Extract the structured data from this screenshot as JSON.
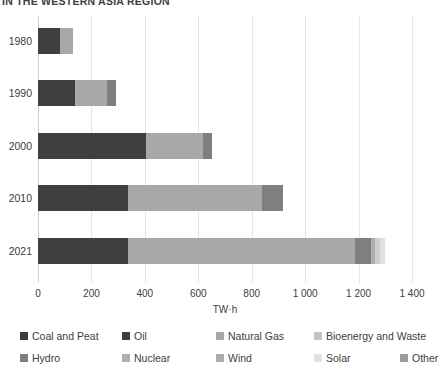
{
  "title": "IN THE WESTERN ASIA REGION",
  "axis": {
    "x_title": "TW·h",
    "x_ticks": [
      "0",
      "200",
      "400",
      "600",
      "800",
      "1 000",
      "1 200",
      "1 400"
    ],
    "x_tick_values": [
      0,
      200,
      400,
      600,
      800,
      1000,
      1200,
      1400
    ],
    "xmin": 0,
    "xmax": 1400
  },
  "legend": {
    "row1": [
      {
        "label": "Coal and Peat",
        "color": "#3b3b3b",
        "left": 20
      },
      {
        "label": "Oil",
        "color": "#3f3f3f",
        "left": 122
      },
      {
        "label": "Natural Gas",
        "color": "#a8a8a8",
        "left": 216
      },
      {
        "label": "Bioenergy and Waste",
        "color": "#c4c4c4",
        "left": 314
      }
    ],
    "row2": [
      {
        "label": "Hydro",
        "color": "#7f7f7f",
        "left": 20
      },
      {
        "label": "Nuclear",
        "color": "#b0b0b0",
        "left": 122
      },
      {
        "label": "Wind",
        "color": "#acacac",
        "left": 216
      },
      {
        "label": "Solar",
        "color": "#e2e2e2",
        "left": 314
      },
      {
        "label": "Other",
        "color": "#9a9a9a",
        "left": 400
      }
    ]
  },
  "chart_data": {
    "type": "bar",
    "orientation": "horizontal",
    "stacked": true,
    "title": "IN THE WESTERN ASIA REGION",
    "xlabel": "TW·h",
    "ylabel": "",
    "xlim": [
      0,
      1400
    ],
    "grid": true,
    "legend_position": "bottom",
    "categories": [
      "1980",
      "1990",
      "2000",
      "2010",
      "2021"
    ],
    "series": [
      {
        "name": "Coal and Peat",
        "color": "#3b3b3b",
        "values": [
          0,
          0,
          0,
          0,
          0
        ]
      },
      {
        "name": "Oil",
        "color": "#3f3f3f",
        "values": [
          82,
          139,
          404,
          337,
          337
        ]
      },
      {
        "name": "Natural Gas",
        "color": "#a8a8a8",
        "values": [
          48,
          120,
          213,
          502,
          850
        ]
      },
      {
        "name": "Bioenergy and Waste",
        "color": "#c4c4c4",
        "values": [
          0,
          0,
          0,
          0,
          0
        ]
      },
      {
        "name": "Hydro",
        "color": "#7f7f7f",
        "values": [
          0,
          34,
          34,
          79,
          60
        ]
      },
      {
        "name": "Nuclear",
        "color": "#b0b0b0",
        "values": [
          0,
          0,
          0,
          0,
          15
        ]
      },
      {
        "name": "Wind",
        "color": "#acacac",
        "values": [
          0,
          0,
          0,
          0,
          18
        ]
      },
      {
        "name": "Solar",
        "color": "#e2e2e2",
        "values": [
          0,
          0,
          0,
          0,
          20
        ]
      },
      {
        "name": "Other",
        "color": "#9a9a9a",
        "values": [
          0,
          0,
          0,
          0,
          0
        ]
      }
    ],
    "totals": [
      130,
      293,
      496,
      918,
      1300
    ]
  },
  "bars": [
    {
      "label": "1980",
      "top": 28,
      "segments": [
        {
          "name": "Oil",
          "value": 82,
          "color": "#3f3f3f"
        },
        {
          "name": "Natural Gas",
          "value": 48,
          "color": "#a8a8a8"
        }
      ]
    },
    {
      "label": "1990",
      "top": 80,
      "segments": [
        {
          "name": "Oil",
          "value": 139,
          "color": "#3f3f3f"
        },
        {
          "name": "Natural Gas",
          "value": 120,
          "color": "#a8a8a8"
        },
        {
          "name": "Hydro",
          "value": 34,
          "color": "#7f7f7f"
        }
      ]
    },
    {
      "label": "2000",
      "top": 133,
      "segments": [
        {
          "name": "Oil",
          "value": 404,
          "color": "#3f3f3f"
        },
        {
          "name": "Natural Gas",
          "value": 213,
          "color": "#a8a8a8"
        },
        {
          "name": "Hydro",
          "value": 34,
          "color": "#7f7f7f"
        }
      ]
    },
    {
      "label": "2010",
      "top": 185,
      "segments": [
        {
          "name": "Oil",
          "value": 337,
          "color": "#3f3f3f"
        },
        {
          "name": "Natural Gas",
          "value": 502,
          "color": "#a8a8a8"
        },
        {
          "name": "Hydro",
          "value": 79,
          "color": "#7f7f7f"
        }
      ]
    },
    {
      "label": "2021",
      "top": 238,
      "segments": [
        {
          "name": "Oil",
          "value": 337,
          "color": "#3f3f3f"
        },
        {
          "name": "Natural Gas",
          "value": 850,
          "color": "#a8a8a8"
        },
        {
          "name": "Hydro",
          "value": 60,
          "color": "#7f7f7f"
        },
        {
          "name": "Nuclear",
          "value": 15,
          "color": "#b0b0b0"
        },
        {
          "name": "Wind",
          "value": 18,
          "color": "#cfcfcf"
        },
        {
          "name": "Solar",
          "value": 20,
          "color": "#e2e2e2"
        }
      ]
    }
  ]
}
